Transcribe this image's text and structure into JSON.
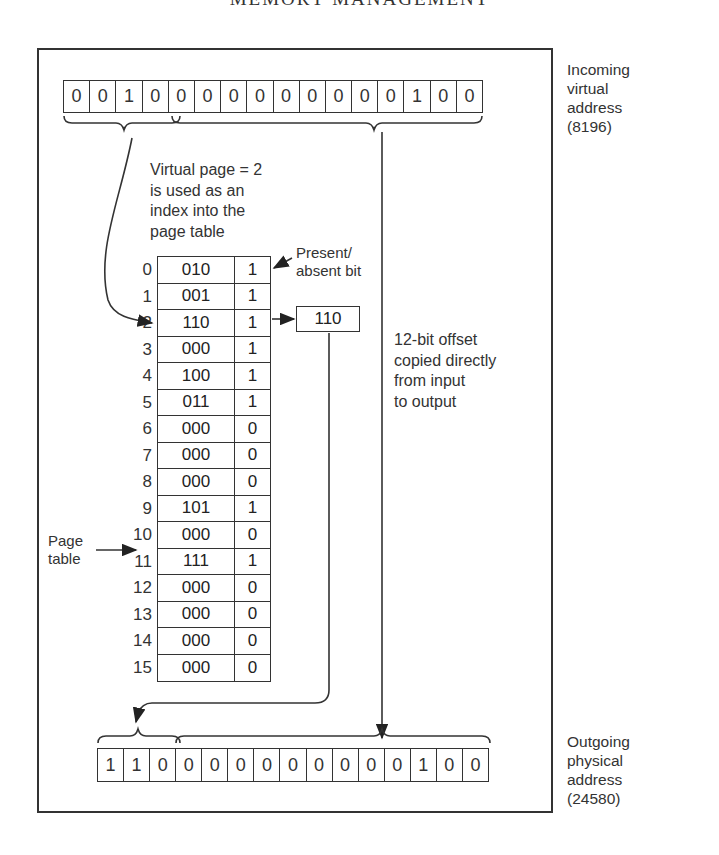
{
  "header": {
    "title": "MEMORY MANAGEMENT"
  },
  "incoming": {
    "bits": [
      "0",
      "0",
      "1",
      "0",
      "0",
      "0",
      "0",
      "0",
      "0",
      "0",
      "0",
      "0",
      "0",
      "1",
      "0",
      "0"
    ],
    "label": "Incoming\nvirtual\naddress\n(8196)"
  },
  "annotations": {
    "virtual_page": "Virtual page = 2\nis used as an\nindex into the\npage table",
    "present_absent": "Present/\nabsent bit",
    "offset": "12-bit offset\ncopied directly\nfrom input\nto output",
    "page_table": "Page\ntable"
  },
  "page_table": {
    "rows": [
      {
        "index": "0",
        "frame": "010",
        "present": "1"
      },
      {
        "index": "1",
        "frame": "001",
        "present": "1"
      },
      {
        "index": "2",
        "frame": "110",
        "present": "1"
      },
      {
        "index": "3",
        "frame": "000",
        "present": "1"
      },
      {
        "index": "4",
        "frame": "100",
        "present": "1"
      },
      {
        "index": "5",
        "frame": "011",
        "present": "1"
      },
      {
        "index": "6",
        "frame": "000",
        "present": "0"
      },
      {
        "index": "7",
        "frame": "000",
        "present": "0"
      },
      {
        "index": "8",
        "frame": "000",
        "present": "0"
      },
      {
        "index": "9",
        "frame": "101",
        "present": "1"
      },
      {
        "index": "10",
        "frame": "000",
        "present": "0"
      },
      {
        "index": "11",
        "frame": "111",
        "present": "1"
      },
      {
        "index": "12",
        "frame": "000",
        "present": "0"
      },
      {
        "index": "13",
        "frame": "000",
        "present": "0"
      },
      {
        "index": "14",
        "frame": "000",
        "present": "0"
      },
      {
        "index": "15",
        "frame": "000",
        "present": "0"
      }
    ]
  },
  "frame_output": {
    "value": "110"
  },
  "outgoing": {
    "bits": [
      "1",
      "1",
      "0",
      "0",
      "0",
      "0",
      "0",
      "0",
      "0",
      "0",
      "0",
      "0",
      "1",
      "0",
      "0"
    ],
    "label": "Outgoing\nphysical\naddress\n(24580)"
  }
}
